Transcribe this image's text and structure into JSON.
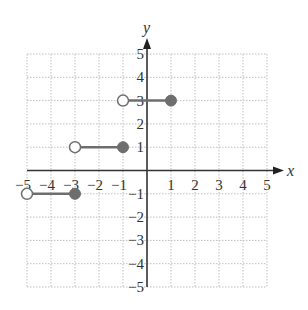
{
  "chart_data": {
    "type": "step",
    "title": "",
    "xlabel": "x",
    "ylabel": "y",
    "xlim": [
      -5,
      5
    ],
    "ylim": [
      -5,
      5
    ],
    "grid": true,
    "x_ticks": [
      "-5",
      "-4",
      "-3",
      "-2",
      "-1",
      "1",
      "2",
      "3",
      "4",
      "5"
    ],
    "y_ticks": [
      "5",
      "4",
      "3",
      "2",
      "1",
      "-1",
      "-2",
      "-3",
      "-4",
      "-5"
    ],
    "segments": [
      {
        "x_start": -5,
        "x_end": -3,
        "y": -1,
        "start_open": true,
        "end_closed": true
      },
      {
        "x_start": -3,
        "x_end": -1,
        "y": 1,
        "start_open": true,
        "end_closed": true
      },
      {
        "x_start": -1,
        "x_end": 1,
        "y": 3,
        "start_open": true,
        "end_closed": true
      }
    ],
    "colors": {
      "segment": "#6e6e6e",
      "axis": "#333333",
      "grid": "#bfbfbf"
    }
  },
  "labels": {
    "x_axis": "x",
    "y_axis": "y",
    "xt": [
      "−5",
      "−4",
      "−3",
      "−2",
      "−1",
      "1",
      "2",
      "3",
      "4",
      "5"
    ],
    "yt": [
      "5",
      "4",
      "3",
      "2",
      "1",
      "−1",
      "−2",
      "−3",
      "−4",
      "−5"
    ]
  }
}
